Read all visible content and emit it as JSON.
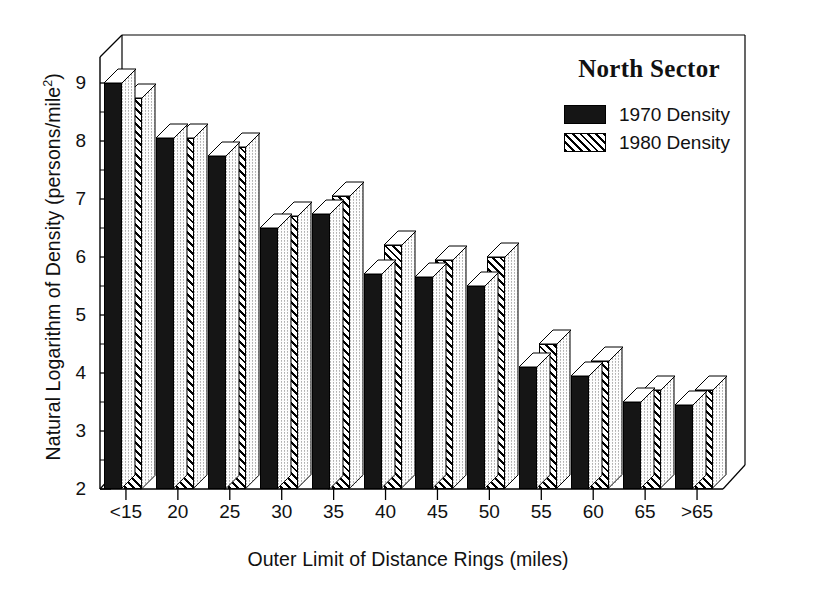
{
  "chart_data": {
    "type": "bar",
    "title": "North Sector",
    "xlabel": "Outer Limit of Distance Rings (miles)",
    "ylabel": "Natural Logarithm of Density (persons/mile",
    "ylabel_sup": "2",
    "ylabel_suffix": ")",
    "categories": [
      "<15",
      "20",
      "25",
      "30",
      "35",
      "40",
      "45",
      "50",
      "55",
      "60",
      "65",
      ">65"
    ],
    "series": [
      {
        "name": "1970 Density",
        "pattern": "solid",
        "values": [
          9.0,
          8.05,
          7.75,
          6.5,
          6.75,
          5.7,
          5.65,
          5.5,
          4.1,
          3.95,
          3.5,
          3.45
        ]
      },
      {
        "name": "1980 Density",
        "pattern": "hatch",
        "values": [
          8.75,
          8.05,
          7.9,
          6.7,
          7.05,
          6.2,
          5.95,
          6.0,
          4.5,
          4.2,
          3.7,
          3.7
        ]
      }
    ],
    "ylim": [
      2,
      9
    ],
    "yticks": [
      "2",
      "3",
      "4",
      "5",
      "6",
      "7",
      "8",
      "9"
    ],
    "yticks_minor_step": 0.5,
    "grid": false,
    "legend_position": "top-right",
    "style": "3d-bars",
    "colors": {
      "series1": "#151515",
      "series2": "#ffffff",
      "axis": "#000000",
      "background": "#ffffff"
    }
  },
  "legend": {
    "title": "North Sector",
    "entries": [
      {
        "label": "1970 Density"
      },
      {
        "label": "1980 Density"
      }
    ]
  }
}
